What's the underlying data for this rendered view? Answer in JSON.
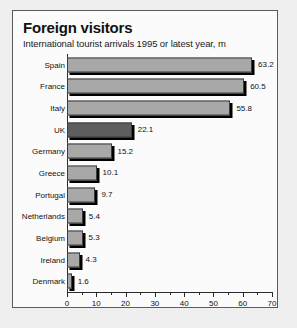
{
  "panel": {
    "title": "Foreign visitors",
    "subtitle": "International tourist arrivals 1995 or latest year, m"
  },
  "chart_data": {
    "type": "bar",
    "orientation": "horizontal",
    "title": "Foreign visitors",
    "subtitle": "International tourist arrivals 1995 or latest year, m",
    "xlabel": "",
    "ylabel": "",
    "xlim": [
      0,
      70
    ],
    "xticks": [
      0,
      10,
      20,
      30,
      40,
      50,
      60,
      70
    ],
    "xticklabels": [
      "0",
      "10",
      "20",
      "30",
      "40",
      "50",
      "60",
      "70"
    ],
    "minor_tick_step": 5,
    "grid": false,
    "legend": false,
    "units": "millions",
    "categories": [
      "Spain",
      "France",
      "Italy",
      "UK",
      "Germany",
      "Greece",
      "Portugal",
      "Netherlands",
      "Belgium",
      "Ireland",
      "Denmark"
    ],
    "values": [
      63.2,
      60.5,
      55.8,
      22.1,
      15.2,
      10.1,
      9.7,
      5.4,
      5.3,
      4.3,
      1.6
    ],
    "value_labels": [
      "63.2",
      "60.5",
      "55.8",
      "22.1",
      "15.2",
      "10.1",
      "9.7",
      "5.4",
      "5.3",
      "4.3",
      "1.6"
    ],
    "highlight_category": "UK",
    "colors": {
      "bar_fill": "#a8a8a8",
      "bar_highlight_fill": "#5e5e5e",
      "bar_border": "#3b3b3b",
      "shadow": "#000000",
      "panel_background": "#fbfbfb",
      "panel_border": "#5a5a5a",
      "text": "#111111",
      "page_background": "#efefef"
    }
  }
}
